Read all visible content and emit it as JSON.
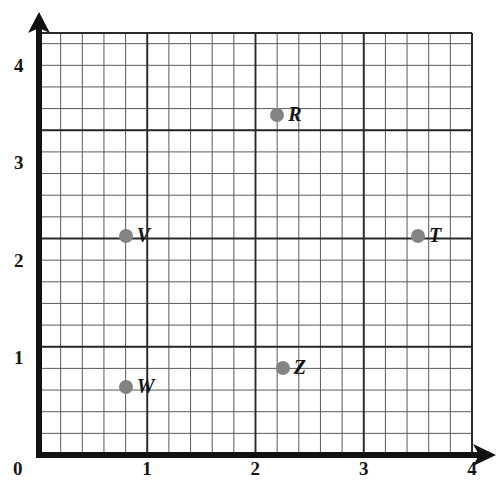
{
  "chart_data": {
    "type": "scatter",
    "title": "",
    "xlabel": "",
    "ylabel": "",
    "xlim": [
      0,
      4.5
    ],
    "ylim": [
      0,
      4.35
    ],
    "grid": true,
    "grid_minor_step": 0.2,
    "legend": "none",
    "x_ticks": [
      "0",
      "1",
      "2",
      "3",
      "4"
    ],
    "x_tick_values": [
      0,
      1,
      2,
      3,
      4
    ],
    "y_ticks": [
      "1",
      "2",
      "3",
      "4"
    ],
    "y_tick_values": [
      1,
      2,
      3,
      4
    ],
    "origin_label": "0",
    "point_color": "#838383",
    "axis_color": "#111111",
    "grid_color": "#555555",
    "points": [
      {
        "label": "R",
        "x": 2.2,
        "y": 3.5
      },
      {
        "label": "T",
        "x": 3.5,
        "y": 2.25
      },
      {
        "label": "V",
        "x": 0.8,
        "y": 2.25
      },
      {
        "label": "W",
        "x": 0.8,
        "y": 0.7
      },
      {
        "label": "Z",
        "x": 2.25,
        "y": 0.9
      }
    ]
  }
}
